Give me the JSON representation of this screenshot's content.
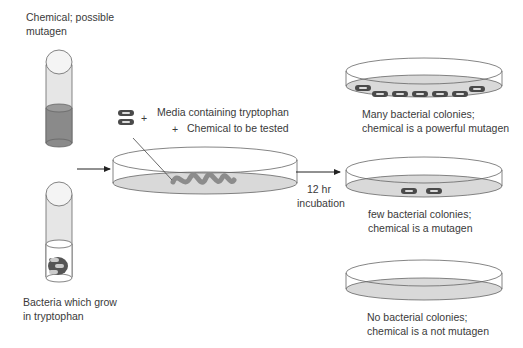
{
  "diagram": {
    "colors": {
      "outline": "#555555",
      "chemical_fill": "#8a8a8a",
      "media_fill": "#d9d9d9",
      "bacteria_fill": "#555555",
      "streak": "#8c8c8c"
    },
    "tube_chemical": {
      "label_line1": "Chemical; possible",
      "label_line2": "mutagen"
    },
    "tube_bacteria": {
      "label_line1": "Bacteria which grow",
      "label_line2": "in tryptophan"
    },
    "center_plate": {
      "ingredient_1": "Media containing tryptophan",
      "ingredient_2": "Chemical to be tested",
      "plus": "+"
    },
    "incubation": {
      "line1": "12 hr",
      "line2": "incubation"
    },
    "results": [
      {
        "line1": "Many bacterial colonies;",
        "line2": "chemical is a powerful mutagen",
        "colonies": 7
      },
      {
        "line1": "few bacterial colonies;",
        "line2": "chemical is a mutagen",
        "colonies": 2
      },
      {
        "line1": "No bacterial colonies;",
        "line2": "chemical is a not mutagen",
        "colonies": 0
      }
    ]
  }
}
